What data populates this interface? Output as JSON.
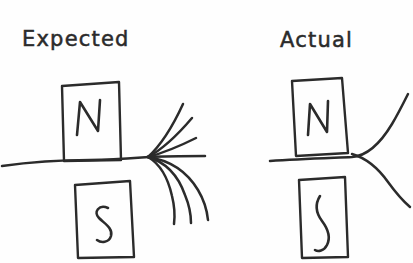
{
  "figure": {
    "background_color": "#fefefe",
    "ink_color": "#2b2b2b",
    "medium": "hand-drawn-sketch",
    "width": 413,
    "height": 263
  },
  "panels": [
    {
      "id": "expected",
      "title": "Expected",
      "magnets": [
        {
          "id": "north",
          "pole_label": "N",
          "position": "upper"
        },
        {
          "id": "south",
          "pole_label": "S",
          "position": "lower"
        }
      ],
      "field": {
        "description": "many field lines converging to a single point then fanning outward",
        "line_count": 7,
        "convergence_point": {
          "x": 148,
          "y": 157
        }
      }
    },
    {
      "id": "actual",
      "title": "Actual",
      "magnets": [
        {
          "id": "north",
          "pole_label": "N",
          "position": "upper"
        },
        {
          "id": "south",
          "pole_label": "S",
          "position": "lower"
        }
      ],
      "field": {
        "description": "two field lines crossing at a point then diverging",
        "line_count": 2,
        "convergence_point": {
          "x": 363,
          "y": 157
        }
      }
    }
  ]
}
